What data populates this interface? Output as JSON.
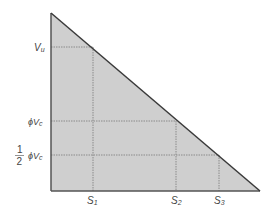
{
  "diagram": {
    "type": "shear-diagram",
    "colors": {
      "fill": "#cfcfcf",
      "outline": "#3a3a3a",
      "gridline": "#8a8a8a",
      "label": "#444444"
    },
    "y_labels": {
      "vu": "V",
      "vu_sub": "u",
      "phi_vc": "ϕV",
      "phi_vc_sub": "c",
      "half_num": "1",
      "half_den": "2",
      "half_phi_vc": "ϕV",
      "half_phi_vc_sub": "c"
    },
    "x_labels": {
      "s1": "S",
      "s1_sub": "1",
      "s2": "S",
      "s2_sub": "2",
      "s3": "S",
      "s3_sub": "3"
    }
  }
}
